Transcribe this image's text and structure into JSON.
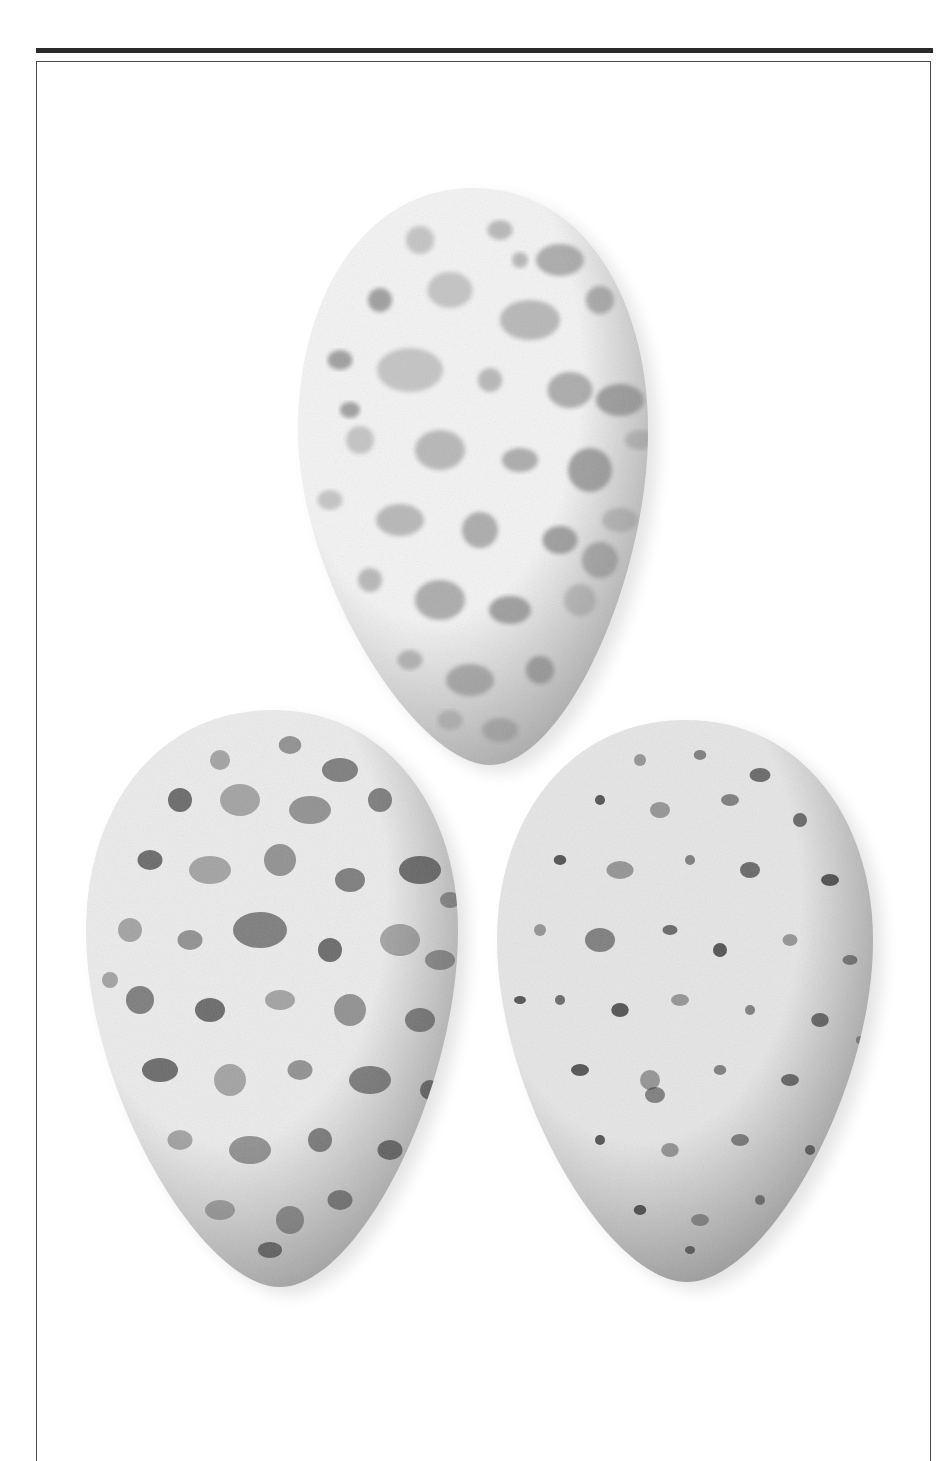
{
  "plate": {
    "caption": "",
    "rule_color": "#2a2a2a",
    "frame_color": "#4a4a4a",
    "background": "#ffffff"
  },
  "eggs": [
    {
      "id": "top",
      "label": "egg-top",
      "cx": 473,
      "top": 188,
      "bottom": 765,
      "halfwidth": 175,
      "widest_y": 430,
      "tip_x": 490,
      "base_light": "#f4f4f4",
      "base_dark": "#9a9a9a",
      "speckle_color": "#8a8a8a",
      "speckles": [
        [
          420,
          240,
          14
        ],
        [
          500,
          230,
          10
        ],
        [
          560,
          260,
          16
        ],
        [
          380,
          300,
          12
        ],
        [
          450,
          290,
          18
        ],
        [
          530,
          320,
          20
        ],
        [
          600,
          300,
          14
        ],
        [
          340,
          360,
          10
        ],
        [
          410,
          370,
          22
        ],
        [
          490,
          380,
          12
        ],
        [
          570,
          390,
          18
        ],
        [
          620,
          400,
          16
        ],
        [
          360,
          440,
          14
        ],
        [
          440,
          450,
          20
        ],
        [
          520,
          460,
          12
        ],
        [
          590,
          470,
          22
        ],
        [
          330,
          500,
          10
        ],
        [
          400,
          520,
          16
        ],
        [
          480,
          530,
          18
        ],
        [
          560,
          540,
          14
        ],
        [
          620,
          520,
          12
        ],
        [
          370,
          580,
          12
        ],
        [
          440,
          600,
          20
        ],
        [
          510,
          610,
          14
        ],
        [
          580,
          600,
          16
        ],
        [
          410,
          660,
          10
        ],
        [
          470,
          680,
          16
        ],
        [
          540,
          670,
          14
        ],
        [
          450,
          720,
          10
        ],
        [
          500,
          730,
          12
        ],
        [
          600,
          560,
          18
        ],
        [
          350,
          410,
          8
        ],
        [
          640,
          440,
          10
        ],
        [
          520,
          260,
          8
        ]
      ]
    },
    {
      "id": "bottom-left",
      "label": "egg-bottom-left",
      "cx": 272,
      "top": 710,
      "bottom": 1287,
      "halfwidth": 186,
      "widest_y": 930,
      "tip_x": 280,
      "base_light": "#ececec",
      "base_dark": "#8e8e8e",
      "speckle_color": "#4a4a4a",
      "speckles": [
        [
          220,
          760,
          10
        ],
        [
          290,
          745,
          9
        ],
        [
          340,
          770,
          12
        ],
        [
          180,
          800,
          12
        ],
        [
          240,
          800,
          16
        ],
        [
          310,
          810,
          14
        ],
        [
          380,
          800,
          12
        ],
        [
          150,
          860,
          10
        ],
        [
          210,
          870,
          14
        ],
        [
          280,
          860,
          16
        ],
        [
          350,
          880,
          12
        ],
        [
          420,
          870,
          14
        ],
        [
          130,
          930,
          12
        ],
        [
          190,
          940,
          10
        ],
        [
          260,
          930,
          18
        ],
        [
          330,
          950,
          12
        ],
        [
          400,
          940,
          16
        ],
        [
          440,
          960,
          10
        ],
        [
          140,
          1000,
          14
        ],
        [
          210,
          1010,
          12
        ],
        [
          280,
          1000,
          10
        ],
        [
          350,
          1010,
          16
        ],
        [
          420,
          1020,
          12
        ],
        [
          160,
          1070,
          12
        ],
        [
          230,
          1080,
          16
        ],
        [
          300,
          1070,
          10
        ],
        [
          370,
          1080,
          14
        ],
        [
          430,
          1090,
          10
        ],
        [
          180,
          1140,
          10
        ],
        [
          250,
          1150,
          14
        ],
        [
          320,
          1140,
          12
        ],
        [
          390,
          1150,
          10
        ],
        [
          220,
          1210,
          10
        ],
        [
          290,
          1220,
          14
        ],
        [
          340,
          1200,
          10
        ],
        [
          270,
          1250,
          8
        ],
        [
          110,
          980,
          8
        ],
        [
          450,
          900,
          8
        ]
      ]
    },
    {
      "id": "bottom-right",
      "label": "egg-bottom-right",
      "cx": 685,
      "top": 720,
      "bottom": 1282,
      "halfwidth": 188,
      "widest_y": 940,
      "tip_x": 687,
      "base_light": "#e6e6e6",
      "base_dark": "#858585",
      "speckle_color": "#2e2e2e",
      "speckles": [
        [
          640,
          760,
          6
        ],
        [
          700,
          755,
          5
        ],
        [
          760,
          775,
          7
        ],
        [
          600,
          800,
          5
        ],
        [
          660,
          810,
          8
        ],
        [
          730,
          800,
          6
        ],
        [
          800,
          820,
          7
        ],
        [
          560,
          860,
          5
        ],
        [
          620,
          870,
          9
        ],
        [
          690,
          860,
          5
        ],
        [
          750,
          870,
          8
        ],
        [
          830,
          880,
          6
        ],
        [
          540,
          930,
          6
        ],
        [
          600,
          940,
          12
        ],
        [
          670,
          930,
          5
        ],
        [
          720,
          950,
          7
        ],
        [
          790,
          940,
          6
        ],
        [
          850,
          960,
          5
        ],
        [
          560,
          1000,
          5
        ],
        [
          620,
          1010,
          7
        ],
        [
          680,
          1000,
          6
        ],
        [
          750,
          1010,
          5
        ],
        [
          820,
          1020,
          7
        ],
        [
          580,
          1070,
          6
        ],
        [
          650,
          1080,
          10
        ],
        [
          720,
          1070,
          5
        ],
        [
          790,
          1080,
          6
        ],
        [
          600,
          1140,
          5
        ],
        [
          670,
          1150,
          7
        ],
        [
          740,
          1140,
          6
        ],
        [
          810,
          1150,
          5
        ],
        [
          640,
          1210,
          5
        ],
        [
          700,
          1220,
          6
        ],
        [
          760,
          1200,
          5
        ],
        [
          690,
          1250,
          4
        ],
        [
          520,
          1000,
          4
        ],
        [
          860,
          1040,
          4
        ],
        [
          655,
          1095,
          8
        ]
      ]
    }
  ]
}
